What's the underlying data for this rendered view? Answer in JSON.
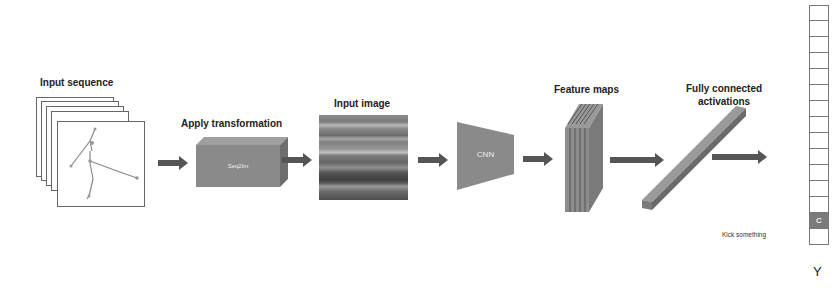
{
  "diagram": {
    "stages": [
      {
        "id": "input-sequence",
        "label": "Input sequence"
      },
      {
        "id": "apply-transformation",
        "label": "Apply transformation",
        "box_text": "Seq2Im"
      },
      {
        "id": "input-image",
        "label": "Input image"
      },
      {
        "id": "cnn",
        "label": "",
        "box_text": "CNN"
      },
      {
        "id": "feature-maps",
        "label": "Feature maps"
      },
      {
        "id": "fully-connected",
        "label_line1": "Fully connected",
        "label_line2": "activations"
      }
    ],
    "output": {
      "column_label": "Y",
      "cells": 15,
      "active_index": 13,
      "active_text": "C",
      "active_class_label": "Kick something"
    },
    "colors": {
      "arrow": "#555555",
      "box": "#8a8a8a",
      "active_cell": "#7b7b7b"
    }
  }
}
